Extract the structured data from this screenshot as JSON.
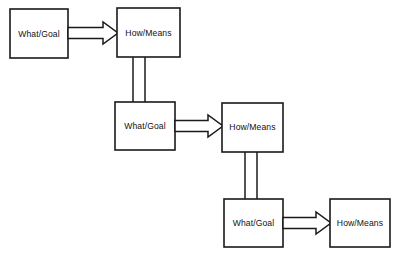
{
  "diagram": {
    "background_color": "#ffffff",
    "line_color": "#1a1a1a",
    "text_color": "#111111",
    "labels": {
      "what_goal": "What/Goal",
      "how_means": "How/Means"
    },
    "nodes": [
      {
        "id": "node-1",
        "label": "What/Goal",
        "type": "what-goal",
        "row": 1,
        "x": 10,
        "y": 9,
        "width": 58,
        "height": 49
      },
      {
        "id": "node-2",
        "label": "How/Means",
        "type": "how-means",
        "row": 1,
        "x": 117,
        "y": 8,
        "width": 63,
        "height": 49
      },
      {
        "id": "node-3",
        "label": "What/Goal",
        "type": "what-goal",
        "row": 2,
        "x": 115,
        "y": 102,
        "width": 60,
        "height": 48
      },
      {
        "id": "node-4",
        "label": "How/Means",
        "type": "how-means",
        "row": 2,
        "x": 222,
        "y": 103,
        "width": 61,
        "height": 49
      },
      {
        "id": "node-5",
        "label": "What/Goal",
        "type": "what-goal",
        "row": 3,
        "x": 224,
        "y": 199,
        "width": 59,
        "height": 48
      },
      {
        "id": "node-6",
        "label": "How/Means",
        "type": "how-means",
        "row": 3,
        "x": 330,
        "y": 199,
        "width": 60,
        "height": 48
      }
    ],
    "arrows": [
      {
        "id": "arrow-1",
        "from": "node-1",
        "to": "node-2",
        "direction": "right",
        "style": "hollow-block-arrow",
        "x1": 68,
        "x2": 117,
        "cy": 33
      },
      {
        "id": "arrow-2",
        "from": "node-3",
        "to": "node-4",
        "direction": "right",
        "style": "hollow-block-arrow",
        "x1": 175,
        "x2": 222,
        "cy": 126
      },
      {
        "id": "arrow-3",
        "from": "node-5",
        "to": "node-6",
        "direction": "right",
        "style": "hollow-block-arrow",
        "x1": 283,
        "x2": 330,
        "cy": 223
      }
    ],
    "connectors": [
      {
        "id": "connector-1",
        "from": "node-2",
        "to": "node-3",
        "direction": "down",
        "style": "double-line",
        "x_left": 133,
        "x_right": 145,
        "y1": 57,
        "y2": 102
      },
      {
        "id": "connector-2",
        "from": "node-4",
        "to": "node-5",
        "direction": "down",
        "style": "double-line",
        "x_left": 245,
        "x_right": 257,
        "y1": 152,
        "y2": 199
      }
    ]
  }
}
